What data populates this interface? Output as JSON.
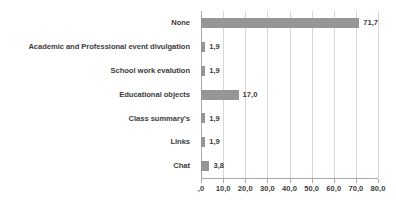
{
  "chart_data": {
    "type": "bar",
    "orientation": "horizontal",
    "title": "",
    "subtitle": "",
    "xlabel": "",
    "ylabel": "",
    "legend": null,
    "grid": true,
    "xlim": [
      0,
      80
    ],
    "xticks": [
      0,
      10,
      20,
      30,
      40,
      50,
      60,
      70,
      80
    ],
    "xtick_labels": [
      ",0",
      "10,0",
      "20,0",
      "30,0",
      "40,0",
      "50,0",
      "60,0",
      "70,0",
      "80,0"
    ],
    "categories": [
      "None",
      "Academic and Professional event divulgation",
      "School work evalution",
      "Educational objects",
      "Class summary's",
      "Links",
      "Chat"
    ],
    "values": [
      71.7,
      1.9,
      1.9,
      17.0,
      1.9,
      1.9,
      3.8
    ],
    "data_labels": [
      "71,7",
      "1,9",
      "1,9",
      "17,0",
      "1,9",
      "1,9",
      "3,8"
    ],
    "colors": {
      "bar": "#969696",
      "gridline": "#d6d6d6",
      "axis": "#a8a8a8",
      "text": "#3d3d3d",
      "background": "#ffffff"
    }
  }
}
